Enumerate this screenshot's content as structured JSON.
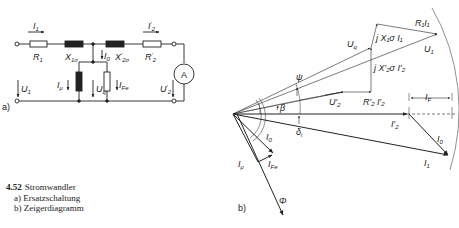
{
  "figure": {
    "number": "4.52",
    "title": "Stromwandler",
    "captions": [
      "a) Ersatzschaltung",
      "b) Zeigerdiagramm"
    ]
  },
  "circuit": {
    "panel_label": "a)",
    "elements": {
      "R1": "R",
      "R1_sub": "1",
      "X1s": "X",
      "X1s_sub": "1σ",
      "X2s": "X",
      "X2s_sub": "2σ",
      "X2s_prime": "′",
      "R2": "R",
      "R2_sub": "2",
      "R2_prime": "′",
      "ammeter": "A"
    },
    "currents": {
      "I1": "I",
      "I1_sub": "1",
      "I2": "I",
      "I2_sub": "2",
      "I2_prime": "′",
      "I0": "I",
      "I0_sub": "0",
      "Imu": "I",
      "Imu_sub": "μ",
      "IFe": "I",
      "IFe_sub": "Fe"
    },
    "voltages": {
      "U1": "U",
      "U1_sub": "1",
      "Uq": "U",
      "Uq_sub": "q",
      "U2": "U",
      "U2_sub": "2",
      "U2_prime": "′"
    }
  },
  "phasor": {
    "panel_label": "b)",
    "labels": {
      "R1I1": "R₁I₁",
      "jX1I1": "j X₁σ I₁",
      "Uq": "U",
      "Uq_sub": "q",
      "U1": "U",
      "U1_sub": "1",
      "jX2I2": "j X′₂σ I′₂",
      "psi": "ψ",
      "beta": "β",
      "U2": "U′",
      "U2_sub": "2",
      "R2I2": "R′₂ I′₂",
      "IF": "I",
      "IF_sub": "F",
      "I2": "I′",
      "I2_sub": "2",
      "delta": "δ",
      "delta_sub": "i",
      "I0": "I",
      "I0_sub": "0",
      "I0b": "I",
      "I0b_sub": "0",
      "I1": "I",
      "I1_sub": "1",
      "Imu": "I",
      "Imu_sub": "μ",
      "IFe": "I",
      "IFe_sub": "Fe",
      "Phi": "Φ"
    }
  }
}
